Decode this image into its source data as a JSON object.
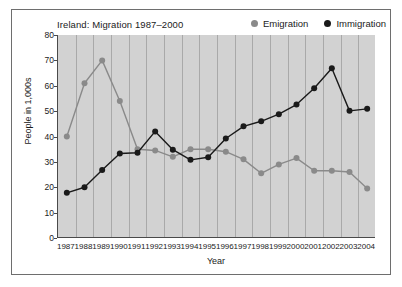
{
  "chart_data": {
    "type": "line",
    "title": "Ireland: Migration 1987–2000",
    "xlabel": "Year",
    "ylabel": "People in 1,000s",
    "categories": [
      "1987",
      "1988",
      "1989",
      "1990",
      "1991",
      "1992",
      "1993",
      "1994",
      "1995",
      "1996",
      "1997",
      "1998",
      "1999",
      "2000",
      "2001",
      "2002",
      "2003",
      "2004"
    ],
    "ylim": [
      0,
      80
    ],
    "yticks": [
      0,
      10,
      20,
      30,
      40,
      50,
      60,
      70,
      80
    ],
    "grid": "vertical",
    "legend_position": "top-right",
    "series": [
      {
        "name": "Emigration",
        "color": "#8a8a8a",
        "values": [
          40.0,
          61.0,
          70.0,
          54.0,
          35.0,
          34.5,
          32.0,
          35.0,
          35.0,
          34.0,
          31.0,
          25.5,
          29.0,
          31.5,
          26.5,
          26.5,
          26.0,
          21.0
        ]
      },
      {
        "name": "Immigration",
        "color": "#1a1a1a",
        "values": [
          17.8,
          20.0,
          26.8,
          33.3,
          33.6,
          42.0,
          34.8,
          30.8,
          31.8,
          39.2,
          44.0,
          46.0,
          48.8,
          52.6,
          59.0,
          66.9,
          50.1,
          50.9
        ]
      }
    ],
    "series_tail_override": {
      "Emigration": {
        "2004": 19.5
      }
    }
  },
  "legend": {
    "items": [
      {
        "label": "Emigration",
        "color": "#8a8a8a",
        "marker": "circle-marker-gray"
      },
      {
        "label": "Immigration",
        "color": "#1a1a1a",
        "marker": "circle-marker-black"
      }
    ]
  },
  "colors": {
    "plot_background": "#d2d2d2",
    "gridline": "#a9a9a9",
    "axis": "#4a4a4a",
    "page_background": "#ffffff",
    "frame_border": "#6e6e6e",
    "text": "#1b1b1b"
  }
}
